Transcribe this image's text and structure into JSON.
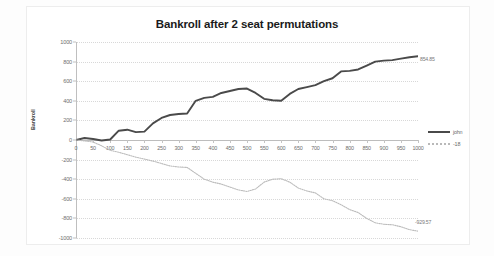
{
  "chart_data": {
    "type": "line",
    "title": "Bankroll after 2 seat permutations",
    "xlabel": "Number of games",
    "ylabel": "Bankroll",
    "xlim": [
      0,
      1000
    ],
    "ylim": [
      -1000,
      1000
    ],
    "grid": true,
    "legend_position": "right",
    "x_ticks": [
      "0",
      "50",
      "100",
      "150",
      "200",
      "250",
      "300",
      "350",
      "400",
      "450",
      "500",
      "550",
      "600",
      "650",
      "700",
      "750",
      "800",
      "850",
      "900",
      "950",
      "1000"
    ],
    "y_ticks": [
      "1000",
      "800",
      "600",
      "400",
      "200",
      "0",
      "-200",
      "-400",
      "-600",
      "-800",
      "-1000"
    ],
    "x": [
      0,
      25,
      50,
      75,
      100,
      125,
      150,
      175,
      200,
      225,
      250,
      275,
      300,
      325,
      350,
      375,
      400,
      425,
      450,
      475,
      500,
      525,
      550,
      575,
      600,
      625,
      650,
      675,
      700,
      725,
      750,
      775,
      800,
      825,
      850,
      875,
      900,
      925,
      950,
      975,
      1000
    ],
    "series": [
      {
        "name": "john",
        "color": "#4a4a4a",
        "style": "solid",
        "end_label": "854.85",
        "values": [
          0,
          20,
          10,
          -5,
          5,
          95,
          105,
          80,
          85,
          170,
          225,
          255,
          265,
          270,
          400,
          430,
          440,
          480,
          500,
          520,
          525,
          480,
          420,
          405,
          400,
          470,
          520,
          540,
          560,
          600,
          630,
          700,
          705,
          720,
          760,
          800,
          810,
          815,
          830,
          845,
          855
        ]
      },
      {
        "name": "-18",
        "color": "#bcbcbc",
        "style": "dotted",
        "end_label": "-929.57",
        "values": [
          0,
          -10,
          -20,
          -60,
          -105,
          -125,
          -150,
          -175,
          -195,
          -215,
          -240,
          -265,
          -275,
          -280,
          -340,
          -400,
          -430,
          -450,
          -480,
          -510,
          -525,
          -500,
          -430,
          -400,
          -395,
          -430,
          -490,
          -520,
          -540,
          -600,
          -620,
          -660,
          -710,
          -740,
          -800,
          -845,
          -860,
          -865,
          -885,
          -915,
          -930
        ]
      }
    ]
  }
}
